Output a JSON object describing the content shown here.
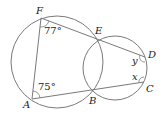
{
  "diagram": {
    "points": {
      "A": {
        "label": "A",
        "x": 32,
        "y": 99
      },
      "B": {
        "label": "B",
        "x": 93,
        "y": 92
      },
      "C": {
        "label": "C",
        "x": 144,
        "y": 82
      },
      "D": {
        "label": "D",
        "x": 145,
        "y": 57
      },
      "E": {
        "label": "E",
        "x": 97,
        "y": 38
      },
      "F": {
        "label": "F",
        "x": 41,
        "y": 18
      }
    },
    "circles": [
      {
        "name": "large",
        "cx": 57,
        "cy": 62,
        "r": 46
      },
      {
        "name": "small",
        "cx": 115,
        "cy": 68,
        "r": 32
      }
    ],
    "segments": [
      "F-A",
      "A-B",
      "B-C",
      "F-E",
      "E-D",
      "E-B",
      "D-C"
    ],
    "angles": {
      "F": "77°",
      "A": "75°",
      "D": "y",
      "C": "x"
    },
    "stroke_color": "#7a7a7a"
  }
}
